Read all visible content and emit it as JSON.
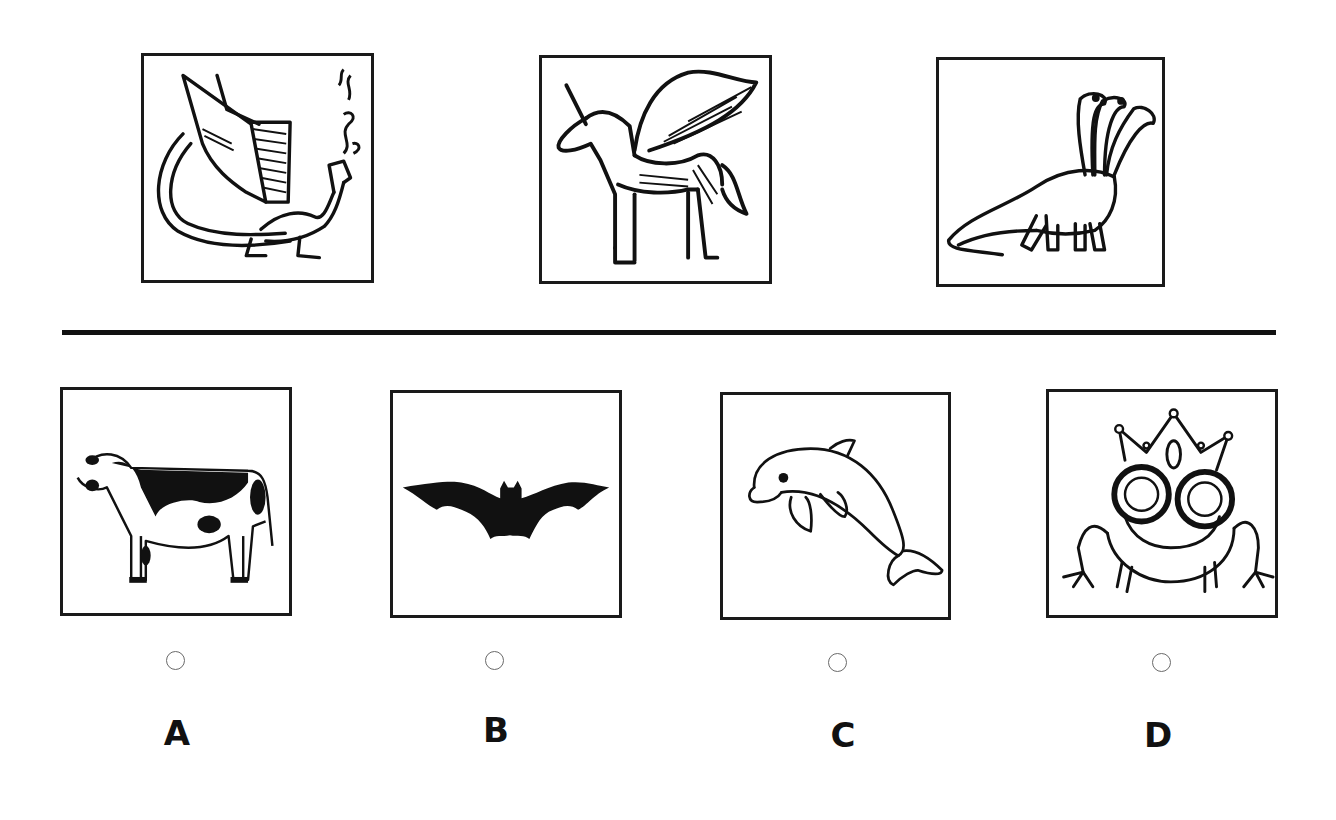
{
  "question": {
    "prompt_figures": [
      {
        "id": "dragon",
        "icon": "winged-dragon-icon",
        "description": "winged dragon breathing smoke"
      },
      {
        "id": "pegasus-unicorn",
        "icon": "winged-unicorn-icon",
        "description": "winged unicorn (alicorn)"
      },
      {
        "id": "hydra",
        "icon": "three-headed-dinosaur-icon",
        "description": "three-headed long-necked creature"
      }
    ],
    "options": [
      {
        "letter": "A",
        "icon": "cow-icon",
        "description": "cow",
        "selected": false
      },
      {
        "letter": "B",
        "icon": "bat-icon",
        "description": "bat",
        "selected": false
      },
      {
        "letter": "C",
        "icon": "dolphin-icon",
        "description": "dolphin",
        "selected": false
      },
      {
        "letter": "D",
        "icon": "frog-prince-icon",
        "description": "frog wearing a crown",
        "selected": false
      }
    ]
  },
  "colors": {
    "ink": "#111111",
    "radio_border": "#6a6a6a",
    "background": "#ffffff"
  }
}
